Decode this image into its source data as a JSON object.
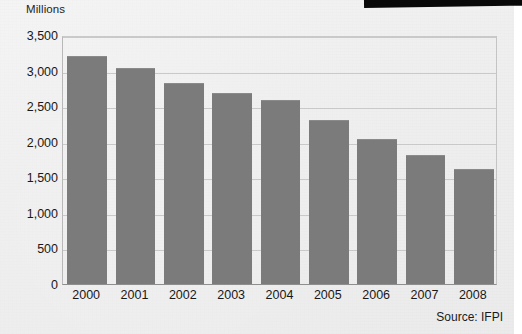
{
  "chart_data": {
    "type": "bar",
    "title": "",
    "ylabel": "Millions",
    "xlabel": "",
    "categories": [
      "2000",
      "2001",
      "2002",
      "2003",
      "2004",
      "2005",
      "2006",
      "2007",
      "2008"
    ],
    "values": [
      3200,
      3030,
      2820,
      2690,
      2590,
      2300,
      2040,
      1810,
      1610
    ],
    "series": [
      {
        "name": "Global recorded music units",
        "values": [
          3200,
          3030,
          2820,
          2690,
          2590,
          2300,
          2040,
          1810,
          1610
        ]
      }
    ],
    "ylim": [
      0,
      3500
    ],
    "ytick_values": [
      0,
      500,
      1000,
      1500,
      2000,
      2500,
      3000,
      3500
    ],
    "ytick_labels": [
      "0",
      "500",
      "1,000",
      "1,500",
      "2,000",
      "2,500",
      "3,000",
      "3,500"
    ],
    "grid": true,
    "legend": false,
    "legend_position": "none",
    "annotations": [
      "Source: IFPI"
    ],
    "bar_color": "#7b7b7b",
    "gridline_color": "#c9c9c9",
    "background_color": "#efefef",
    "text_color": "#181818"
  },
  "source_note": "Source: IFPI"
}
